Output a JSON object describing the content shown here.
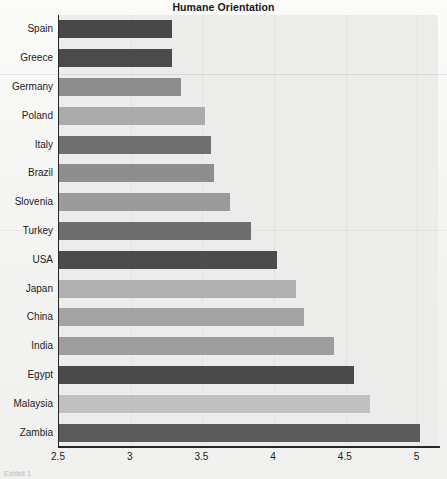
{
  "chart_data": {
    "type": "bar",
    "orientation": "horizontal",
    "title": "Humane Orientation",
    "xlabel": "",
    "ylabel": "",
    "xlim": [
      2.5,
      5.15
    ],
    "xticks": [
      "2.5",
      "3",
      "3.5",
      "4",
      "4.5",
      "5"
    ],
    "xtick_values": [
      2.5,
      3,
      3.5,
      4,
      4.5,
      5
    ],
    "grid": true,
    "legend": "none",
    "categories": [
      "Spain",
      "Greece",
      "Germany",
      "Poland",
      "Italy",
      "Brazil",
      "Slovenia",
      "Turkey",
      "USA",
      "Japan",
      "China",
      "India",
      "Egypt",
      "Malaysia",
      "Zambia"
    ],
    "values": [
      3.29,
      3.29,
      3.35,
      3.52,
      3.56,
      3.58,
      3.69,
      3.84,
      4.02,
      4.15,
      4.21,
      4.42,
      4.56,
      4.67,
      5.02
    ],
    "bar_colors": [
      "#484848",
      "#4b4b4b",
      "#8d8d8d",
      "#ababab",
      "#6f6f6f",
      "#8e8e8e",
      "#9b9b9b",
      "#6e6e6e",
      "#4c4c4c",
      "#b0b0b0",
      "#a3a3a3",
      "#9e9e9e",
      "#4a4a4a",
      "#c0c0c0",
      "#5a5a5a"
    ]
  },
  "plot": {
    "background": "#ececea",
    "axis_color": "#26262a",
    "gridline_color": "#e2e2df"
  },
  "caption": {
    "bottom_text": "Exhibit 1"
  }
}
